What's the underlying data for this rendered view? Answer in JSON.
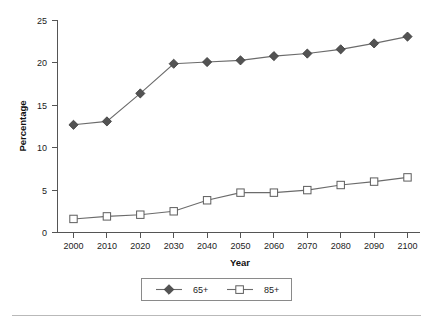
{
  "chart_data": {
    "type": "line",
    "title": "",
    "xlabel": "Year",
    "ylabel": "Percentage",
    "categories": [
      "2000",
      "2010",
      "2020",
      "2030",
      "2040",
      "2050",
      "2060",
      "2070",
      "2080",
      "2090",
      "2100"
    ],
    "x": [
      2000,
      2010,
      2020,
      2030,
      2040,
      2050,
      2060,
      2070,
      2080,
      2090,
      2100
    ],
    "series": [
      {
        "name": "65+",
        "marker": "filled-diamond",
        "color": "#535353",
        "values": [
          12.7,
          13.1,
          16.4,
          19.9,
          20.1,
          20.3,
          20.8,
          21.1,
          21.6,
          22.3,
          23.1
        ]
      },
      {
        "name": "85+",
        "marker": "open-square",
        "color": "#5d5d5d",
        "values": [
          1.6,
          1.9,
          2.1,
          2.5,
          3.8,
          4.7,
          4.7,
          5.0,
          5.6,
          6.0,
          6.5
        ]
      }
    ],
    "xlim": [
      2000,
      2100
    ],
    "ylim": [
      0,
      25
    ],
    "yticks": [
      0,
      5,
      10,
      15,
      20,
      25
    ],
    "ytick_labels": [
      "0",
      "5",
      "10",
      "15",
      "20",
      "25"
    ],
    "xtick_labels": [
      "2000",
      "2010",
      "2020",
      "2030",
      "2040",
      "2050",
      "2060",
      "2070",
      "2080",
      "2090",
      "2100"
    ],
    "grid": false,
    "legend_position": "bottom-center",
    "legend_entries": [
      "65+",
      "85+"
    ],
    "line_color": "#6b6b6b",
    "axis_color": "#555555",
    "background": "#ffffff"
  },
  "legend": {
    "items": [
      {
        "label": "65+",
        "marker": "filled-diamond"
      },
      {
        "label": "85+",
        "marker": "open-square"
      }
    ]
  },
  "axes": {
    "y_title": "Percentage",
    "x_title": "Year",
    "y_ticks": [
      "25",
      "20",
      "15",
      "10",
      "5",
      "0"
    ],
    "x_ticks": [
      "2000",
      "2010",
      "2020",
      "2030",
      "2040",
      "2050",
      "2060",
      "2070",
      "2080",
      "2090",
      "2100"
    ]
  }
}
